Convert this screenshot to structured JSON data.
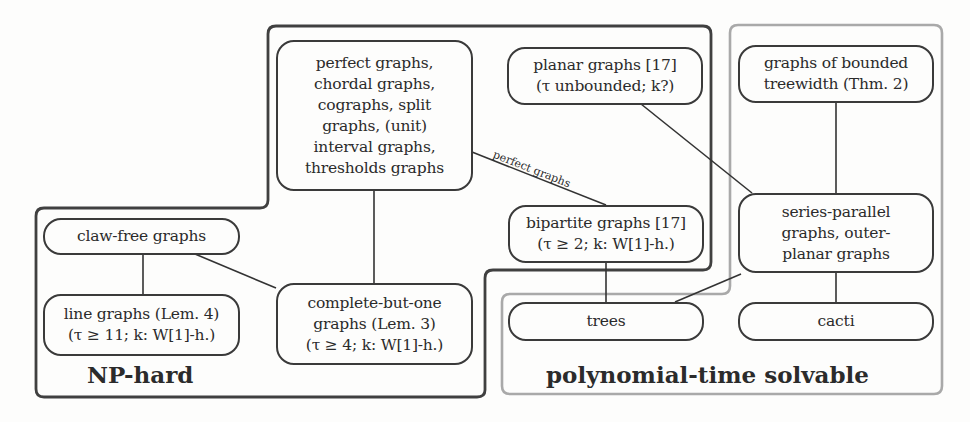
{
  "figure": {
    "regions": {
      "np_hard": {
        "label": "NP-hard",
        "border_color": "#3a3a3a"
      },
      "poly": {
        "label": "polynomial-time solvable",
        "border_color": "#a8a8a8"
      }
    },
    "nodes": {
      "perfect": {
        "lines": [
          "perfect graphs,",
          "chordal graphs,",
          "cographs, split",
          "graphs, (unit)",
          "interval graphs,",
          "thresholds graphs"
        ]
      },
      "planar": {
        "lines": [
          "planar graphs [17]",
          "(τ unbounded; k?)"
        ]
      },
      "bounded_treewidth": {
        "lines": [
          "graphs of bounded",
          "treewidth (Thm. 2)"
        ]
      },
      "bipartite": {
        "lines": [
          "bipartite graphs [17]",
          "(τ ≥ 2; k: W[1]-h.)"
        ]
      },
      "series_parallel": {
        "lines": [
          "series-parallel",
          "graphs, outer-",
          "planar graphs"
        ]
      },
      "claw_free": {
        "lines": [
          "claw-free graphs"
        ]
      },
      "line_graphs": {
        "lines": [
          "line graphs (Lem. 4)",
          "(τ ≥ 11; k: W[1]-h.)"
        ]
      },
      "complete_but_one": {
        "lines": [
          "complete-but-one",
          "graphs (Lem. 3)",
          "(τ ≥ 4; k: W[1]-h.)"
        ]
      },
      "trees": {
        "lines": [
          "trees"
        ]
      },
      "cacti": {
        "lines": [
          "cacti"
        ]
      }
    },
    "edge_labels": {
      "perfect_bipartite": "perfect graphs"
    },
    "edges": [
      [
        "perfect",
        "complete_but_one"
      ],
      [
        "perfect",
        "bipartite"
      ],
      [
        "claw_free",
        "line_graphs"
      ],
      [
        "claw_free",
        "complete_but_one"
      ],
      [
        "planar",
        "series_parallel"
      ],
      [
        "bounded_treewidth",
        "series_parallel"
      ],
      [
        "bipartite",
        "trees"
      ],
      [
        "series_parallel",
        "trees"
      ],
      [
        "series_parallel",
        "cacti"
      ]
    ]
  }
}
